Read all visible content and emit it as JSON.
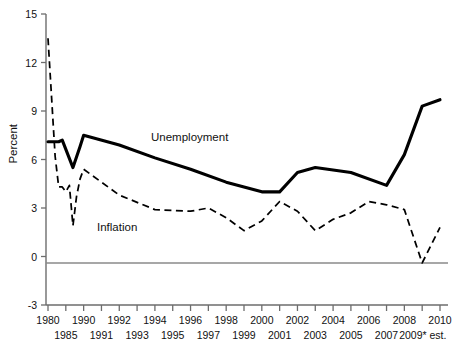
{
  "chart_data": {
    "type": "line",
    "title": "",
    "subtitle": "",
    "xlabel": "",
    "ylabel": "Percent",
    "ylim": [
      -3,
      15
    ],
    "yticks": [
      15,
      12,
      9,
      6,
      3,
      0,
      -3
    ],
    "ytick_labels": [
      "15",
      "12",
      "9",
      "6",
      "3",
      "0",
      "-3"
    ],
    "grid": false,
    "legend": "inline-annotations",
    "zero_line": true,
    "x": [
      1980,
      1985,
      1986,
      1987,
      1988,
      1989,
      1990,
      1991,
      1992,
      1993,
      1994,
      1995,
      1996,
      1997,
      1998,
      1999,
      2000,
      2001,
      2002,
      2003,
      2004,
      2005,
      2006,
      2007,
      2008,
      2009,
      2010
    ],
    "xtick_labels_top": [
      "1980",
      "",
      "1990",
      "",
      "1992",
      "",
      "1994",
      "",
      "1996",
      "",
      "1998",
      "",
      "2000",
      "",
      "2002",
      "",
      "2004",
      "",
      "2006",
      "",
      "2008",
      "",
      "2010"
    ],
    "xtick_labels_bottom": [
      "",
      "1985",
      "",
      "1991",
      "",
      "1993",
      "",
      "1995",
      "",
      "1997",
      "",
      "1999",
      "",
      "2001",
      "",
      "2003",
      "",
      "2005",
      "",
      "2007",
      "",
      "2009* est.",
      ""
    ],
    "xtick_rows": [
      {
        "label": "1980",
        "row": "top",
        "index": 0
      },
      {
        "label": "1985",
        "row": "bottom",
        "index": 1
      },
      {
        "label": "1990",
        "row": "top",
        "index": 2
      },
      {
        "label": "1991",
        "row": "bottom",
        "index": 3
      },
      {
        "label": "1992",
        "row": "top",
        "index": 4
      },
      {
        "label": "1993",
        "row": "bottom",
        "index": 5
      },
      {
        "label": "1994",
        "row": "top",
        "index": 6
      },
      {
        "label": "1995",
        "row": "bottom",
        "index": 7
      },
      {
        "label": "1996",
        "row": "top",
        "index": 8
      },
      {
        "label": "1997",
        "row": "bottom",
        "index": 9
      },
      {
        "label": "1998",
        "row": "top",
        "index": 10
      },
      {
        "label": "1999",
        "row": "bottom",
        "index": 11
      },
      {
        "label": "2000",
        "row": "top",
        "index": 12
      },
      {
        "label": "2001",
        "row": "bottom",
        "index": 13
      },
      {
        "label": "2002",
        "row": "top",
        "index": 14
      },
      {
        "label": "2003",
        "row": "bottom",
        "index": 15
      },
      {
        "label": "2004",
        "row": "top",
        "index": 16
      },
      {
        "label": "2005",
        "row": "bottom",
        "index": 17
      },
      {
        "label": "2006",
        "row": "top",
        "index": 18
      },
      {
        "label": "2007",
        "row": "bottom",
        "index": 19
      },
      {
        "label": "2008",
        "row": "top",
        "index": 20
      },
      {
        "label": "2009* est.",
        "row": "bottom",
        "index": 21
      },
      {
        "label": "2010",
        "row": "top",
        "index": 22
      }
    ],
    "series": [
      {
        "name": "Unemployment",
        "style": "solid-thick",
        "color": "#000000",
        "label_text": "Unemployment",
        "points": [
          {
            "x": 1980,
            "y": 7.1
          },
          {
            "x": 1983,
            "y": 7.1
          },
          {
            "x": 1984,
            "y": 7.2
          },
          {
            "x": 1987,
            "y": 5.5
          },
          {
            "x": 1989,
            "y": 6.8
          },
          {
            "x": 1990,
            "y": 7.5
          },
          {
            "x": 1992,
            "y": 6.9
          },
          {
            "x": 1994,
            "y": 6.1
          },
          {
            "x": 1996,
            "y": 5.4
          },
          {
            "x": 1998,
            "y": 4.6
          },
          {
            "x": 2000,
            "y": 4.0
          },
          {
            "x": 2001,
            "y": 4.0
          },
          {
            "x": 2002,
            "y": 5.2
          },
          {
            "x": 2003,
            "y": 5.5
          },
          {
            "x": 2005,
            "y": 5.2
          },
          {
            "x": 2007,
            "y": 4.4
          },
          {
            "x": 2008,
            "y": 6.3
          },
          {
            "x": 2009,
            "y": 9.3
          },
          {
            "x": 2010,
            "y": 9.7
          }
        ]
      },
      {
        "name": "Inflation",
        "style": "dashed",
        "color": "#000000",
        "label_text": "Inflation",
        "points": [
          {
            "x": 1980,
            "y": 13.5
          },
          {
            "x": 1982,
            "y": 6.2
          },
          {
            "x": 1983,
            "y": 4.3
          },
          {
            "x": 1984,
            "y": 4.3
          },
          {
            "x": 1985,
            "y": 4.0
          },
          {
            "x": 1986,
            "y": 4.4
          },
          {
            "x": 1987,
            "y": 1.9
          },
          {
            "x": 1988,
            "y": 3.7
          },
          {
            "x": 1989,
            "y": 4.8
          },
          {
            "x": 1990,
            "y": 5.4
          },
          {
            "x": 1992,
            "y": 3.8
          },
          {
            "x": 1994,
            "y": 2.9
          },
          {
            "x": 1996,
            "y": 2.8
          },
          {
            "x": 1997,
            "y": 3.0
          },
          {
            "x": 1998,
            "y": 2.4
          },
          {
            "x": 1999,
            "y": 1.6
          },
          {
            "x": 2000,
            "y": 2.2
          },
          {
            "x": 2001,
            "y": 3.4
          },
          {
            "x": 2002,
            "y": 2.8
          },
          {
            "x": 2003,
            "y": 1.6
          },
          {
            "x": 2004,
            "y": 2.3
          },
          {
            "x": 2005,
            "y": 2.7
          },
          {
            "x": 2006,
            "y": 3.4
          },
          {
            "x": 2007,
            "y": 3.2
          },
          {
            "x": 2008,
            "y": 2.9
          },
          {
            "x": 2009,
            "y": -0.4
          },
          {
            "x": 2010,
            "y": 1.8
          }
        ]
      }
    ],
    "annotations": [
      {
        "text": "Unemployment",
        "for": "Unemployment"
      },
      {
        "text": "Inflation",
        "for": "Inflation"
      }
    ]
  },
  "axis": {
    "y_title": "Percent",
    "y_labels": [
      "15",
      "12",
      "9",
      "6",
      "3",
      "0",
      "-3"
    ]
  },
  "labels": {
    "unemployment": "Unemployment",
    "inflation": "Inflation"
  },
  "colors": {
    "line": "#000000",
    "axis": "#6d6d6d",
    "zero": "#8a8a8a",
    "background": "#ffffff"
  }
}
